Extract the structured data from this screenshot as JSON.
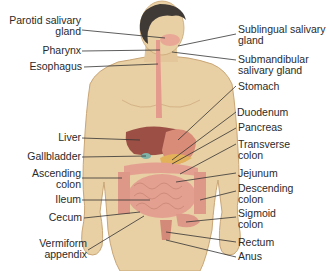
{
  "diagram": {
    "colors": {
      "skin": "#e8cfa4",
      "skin_shadow": "#c9a676",
      "hair": "#3f3a36",
      "esophagus": "#e49a8c",
      "liver": "#9b4f45",
      "stomach": "#d98d78",
      "pancreas": "#e2b15a",
      "gallbladder": "#7fb3a8",
      "intestine": "#e3a090",
      "leader_line": "#333333",
      "label_text": "#2a2a2a"
    },
    "labels_left": [
      {
        "id": "parotid",
        "lines": [
          "Parotid salivary",
          "gland"
        ]
      },
      {
        "id": "pharynx",
        "lines": [
          "Pharynx"
        ]
      },
      {
        "id": "esophagus",
        "lines": [
          "Esophagus"
        ]
      },
      {
        "id": "liver",
        "lines": [
          "Liver"
        ]
      },
      {
        "id": "gallbladder",
        "lines": [
          "Gallbladder"
        ]
      },
      {
        "id": "ascending-colon",
        "lines": [
          "Ascending",
          "colon"
        ]
      },
      {
        "id": "ileum",
        "lines": [
          "Ileum"
        ]
      },
      {
        "id": "cecum",
        "lines": [
          "Cecum"
        ]
      },
      {
        "id": "appendix",
        "lines": [
          "Vermiform",
          "appendix"
        ]
      }
    ],
    "labels_right": [
      {
        "id": "sublingual",
        "lines": [
          "Sublingual salivary",
          "gland"
        ]
      },
      {
        "id": "submandibular",
        "lines": [
          "Submandibular",
          "salivary gland"
        ]
      },
      {
        "id": "stomach",
        "lines": [
          "Stomach"
        ]
      },
      {
        "id": "duodenum",
        "lines": [
          "Duodenum"
        ]
      },
      {
        "id": "pancreas",
        "lines": [
          "Pancreas"
        ]
      },
      {
        "id": "transverse-colon",
        "lines": [
          "Transverse",
          "colon"
        ]
      },
      {
        "id": "jejunum",
        "lines": [
          "Jejunum"
        ]
      },
      {
        "id": "descending-colon",
        "lines": [
          "Descending",
          "colon"
        ]
      },
      {
        "id": "sigmoid-colon",
        "lines": [
          "Sigmoid",
          "colon"
        ]
      },
      {
        "id": "rectum",
        "lines": [
          "Rectum"
        ]
      },
      {
        "id": "anus",
        "lines": [
          "Anus"
        ]
      }
    ]
  }
}
